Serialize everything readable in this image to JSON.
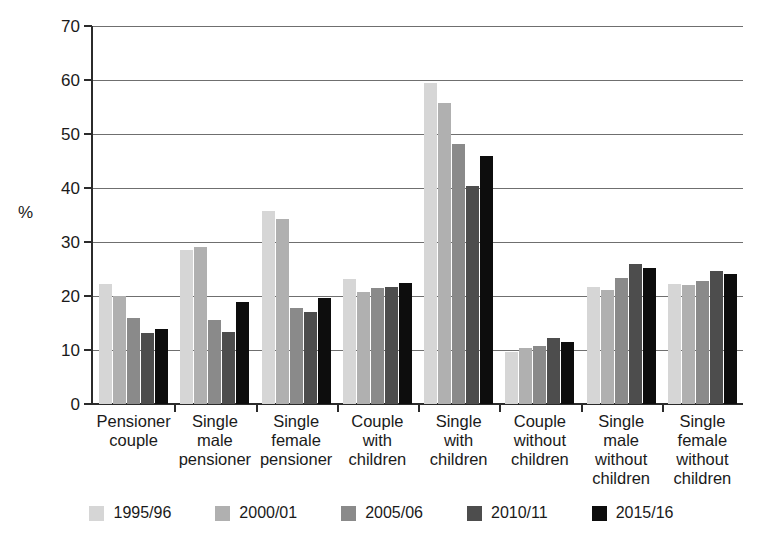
{
  "chart_data": {
    "type": "bar",
    "title": "",
    "subtitle": "",
    "xlabel": "",
    "ylabel": "%",
    "ylim": [
      0,
      70
    ],
    "yticks": [
      0,
      10,
      20,
      30,
      40,
      50,
      60,
      70
    ],
    "ytick_labels": [
      "0",
      "10",
      "20",
      "30",
      "40",
      "50",
      "60",
      "70"
    ],
    "grid": true,
    "legend_position": "bottom",
    "categories": [
      "Pensioner couple",
      "Single male pensioner",
      "Single female pensioner",
      "Couple with children",
      "Single with children",
      "Couple without children",
      "Single male without children",
      "Single female without children"
    ],
    "category_lines": [
      [
        "Pensioner",
        "couple"
      ],
      [
        "Single",
        "male",
        "pensioner"
      ],
      [
        "Single",
        "female",
        "pensioner"
      ],
      [
        "Couple",
        "with",
        "children"
      ],
      [
        "Single",
        "with",
        "children"
      ],
      [
        "Couple",
        "without",
        "children"
      ],
      [
        "Single",
        "male",
        "without",
        "children"
      ],
      [
        "Single",
        "female",
        "without",
        "children"
      ]
    ],
    "series": [
      {
        "name": "1995/96",
        "color": "#d6d6d6",
        "values": [
          22.2,
          28.6,
          35.8,
          23.2,
          59.5,
          9.7,
          21.6,
          22.3
        ]
      },
      {
        "name": "2000/01",
        "color": "#b0b0b0",
        "values": [
          20.0,
          29.0,
          34.2,
          20.8,
          55.8,
          10.3,
          21.2,
          22.0
        ]
      },
      {
        "name": "2005/06",
        "color": "#8a8a8a",
        "values": [
          16.0,
          15.6,
          17.8,
          21.4,
          48.2,
          10.8,
          23.3,
          22.8
        ]
      },
      {
        "name": "2010/11",
        "color": "#4d4d4d",
        "values": [
          13.2,
          13.3,
          17.0,
          21.7,
          40.3,
          12.2,
          26.0,
          24.6
        ]
      },
      {
        "name": "2015/16",
        "color": "#0d0d0d",
        "values": [
          13.8,
          18.8,
          19.7,
          22.5,
          46.0,
          11.5,
          25.2,
          24.1
        ]
      }
    ]
  },
  "axis": {
    "y_label": "%"
  }
}
